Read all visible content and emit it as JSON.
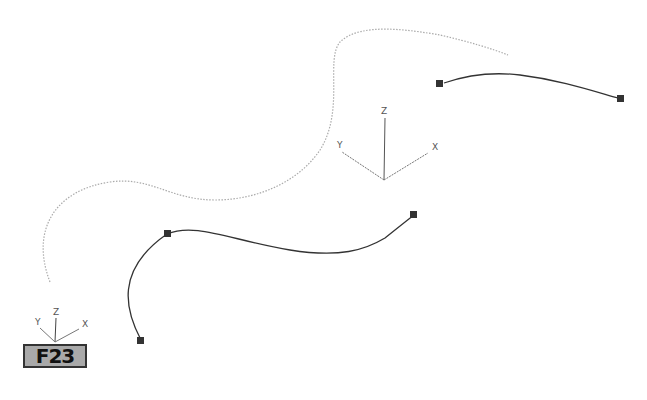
{
  "figure": {
    "badge_label": "F23",
    "gizmo_main": {
      "x_label": "X",
      "y_label": "Y",
      "z_label": "Z"
    },
    "gizmo_corner": {
      "x_label": "X",
      "y_label": "Y",
      "z_label": "Z"
    },
    "curves": [
      {
        "name": "dotted-reference-curve",
        "style": "dotted",
        "color": "#aaaaaa"
      },
      {
        "name": "upper-right-curve",
        "style": "solid",
        "color": "#333333",
        "vertices": [
          [
            439,
            83
          ],
          [
            621,
            98
          ]
        ]
      },
      {
        "name": "lower-curve",
        "style": "solid",
        "color": "#333333",
        "vertices": [
          [
            141,
            341
          ],
          [
            167,
            234
          ],
          [
            414,
            215
          ]
        ]
      }
    ]
  }
}
